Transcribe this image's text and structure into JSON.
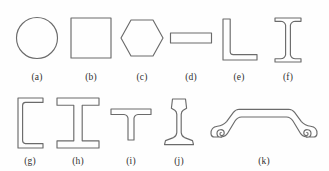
{
  "figure": {
    "background_color": "#fefefe",
    "stroke_color": "#6b6b6b",
    "row_count": 2
  },
  "shapes": [
    {
      "key": "a",
      "label": "(a)",
      "name": "circular-round-bar",
      "row": 1,
      "description": "Solid round bar, circular cross section"
    },
    {
      "key": "b",
      "label": "(b)",
      "name": "square-bar",
      "row": 1,
      "description": "Solid square bar, square cross section"
    },
    {
      "key": "c",
      "label": "(c)",
      "name": "hexagonal-bar",
      "row": 1,
      "description": "Solid hexagonal bar with flat top and bottom and pointed left and right vertices"
    },
    {
      "key": "d",
      "label": "(d)",
      "name": "flat-bar-plate",
      "row": 1,
      "description": "Flat rectangular bar or plate strip, wide and thin"
    },
    {
      "key": "e",
      "label": "(e)",
      "name": "angle-section",
      "row": 1,
      "description": "Equal leg angle section, L shaped profile"
    },
    {
      "key": "f",
      "label": "(f)",
      "name": "narrow-i-beam-tapered-flange",
      "row": 1,
      "description": "Narrow I beam with tapered flanges, standard S shape"
    },
    {
      "key": "g",
      "label": "(g)",
      "name": "channel-section",
      "row": 2,
      "description": "Channel section, C shaped profile with tapered flanges"
    },
    {
      "key": "h",
      "label": "(h)",
      "name": "wide-flange-i-beam",
      "row": 2,
      "description": "Wide flange I beam with straight parallel flanges"
    },
    {
      "key": "i",
      "label": "(i)",
      "name": "tee-section",
      "row": 2,
      "description": "Structural tee section, T shaped profile"
    },
    {
      "key": "j",
      "label": "(j)",
      "name": "railroad-rail-section",
      "row": 2,
      "description": "Railroad rail profile with head, web and wide base foot"
    },
    {
      "key": "k",
      "label": "(k)",
      "name": "sheet-pile-section",
      "row": 2,
      "description": "Roll formed sheet pile or hat section with trapezoidal crown and curled interlock hooks at both ends"
    }
  ]
}
